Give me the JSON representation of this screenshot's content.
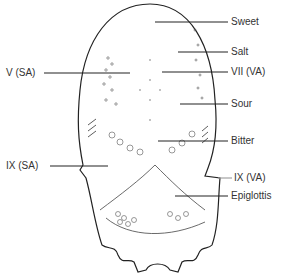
{
  "diagram": {
    "labels_right": [
      {
        "text": "Sweet",
        "y": 22
      },
      {
        "text": "Salt",
        "y": 52
      },
      {
        "text": "VII (VA)",
        "y": 72
      },
      {
        "text": "Sour",
        "y": 105
      },
      {
        "text": "Bitter",
        "y": 142
      },
      {
        "text": "IX (VA)",
        "y": 179
      },
      {
        "text": "Epiglottis",
        "y": 196
      }
    ],
    "labels_left": [
      {
        "text": "V (SA)",
        "y": 73
      },
      {
        "text": "IX (SA)",
        "y": 166
      }
    ],
    "line_color": "#222222",
    "text_color": "#333333"
  }
}
